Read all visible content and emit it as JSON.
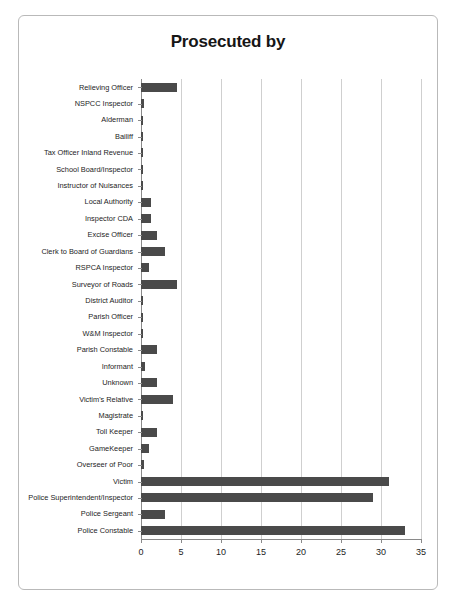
{
  "chart_data": {
    "type": "bar",
    "orientation": "horizontal",
    "title": "Prosecuted by",
    "xlabel": "",
    "ylabel": "",
    "xlim": [
      0,
      35
    ],
    "xticks": [
      0,
      5,
      10,
      15,
      20,
      25,
      30,
      35
    ],
    "grid": "vertical",
    "legend": "none",
    "bar_color": "#4a4a4a",
    "categories": [
      "Relieving Officer",
      "NSPCC Inspector",
      "Alderman",
      "Bailiff",
      "Tax Officer Inland Revenue",
      "School Board/Inspector",
      "Instructor of Nuisances",
      "Local Authority",
      "Inspector CDA",
      "Excise Officer",
      "Clerk to Board of Guardians",
      "RSPCA Inspector",
      "Surveyor of Roads",
      "District Auditor",
      "Parish Officer",
      "W&M Inspector",
      "Parish Constable",
      "Informant",
      "Unknown",
      "Victim's Relative",
      "Magistrate",
      "Toll Keeper",
      "GameKeeper",
      "Overseer of Poor",
      "Victim",
      "Police Superintendent/Inspector",
      "Police Sergeant",
      "Police Constable"
    ],
    "values": [
      4.5,
      0.4,
      0.3,
      0.3,
      0.3,
      0.3,
      0.3,
      1.2,
      1.2,
      2,
      3,
      1,
      4.5,
      0.3,
      0.3,
      0.3,
      2,
      0.5,
      2,
      4,
      0.3,
      2,
      1,
      0.4,
      31,
      29,
      3,
      33
    ]
  }
}
